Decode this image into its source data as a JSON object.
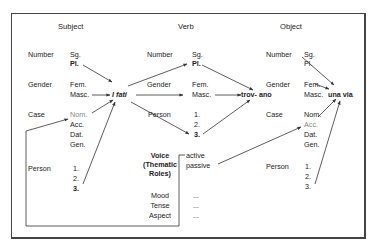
{
  "subject": {
    "title": "Subject",
    "labels": {
      "number": "Number",
      "gender": "Gender",
      "case": "Case",
      "person": "Person"
    },
    "number": [
      "Sg.",
      "Pl."
    ],
    "gender": [
      "Fem.",
      "Masc."
    ],
    "case": [
      "Nom.",
      "Acc.",
      "Dat.",
      "Gen."
    ],
    "person": [
      "1.",
      "2.",
      "3."
    ],
    "word": "I fati"
  },
  "verb": {
    "title": "Verb",
    "labels": {
      "number": "Number",
      "gender": "Gender",
      "person": "Person"
    },
    "number": [
      "Sg.",
      "Pl."
    ],
    "gender": [
      "Fem.",
      "Masc."
    ],
    "person": [
      "1.",
      "2.",
      "3."
    ],
    "word": "trov- ano",
    "voice_label": [
      "Voice",
      "(Thematic",
      "Roles)"
    ],
    "voice": [
      "active",
      "passive"
    ],
    "other_labels": [
      "Mood",
      "Tense",
      "Aspect"
    ],
    "other_values": [
      "...",
      "...",
      "..."
    ]
  },
  "object": {
    "title": "Object",
    "labels": {
      "number": "Number",
      "gender": "Gender",
      "case": "Case",
      "person": "Person"
    },
    "number": [
      "Sg.",
      "Pl."
    ],
    "gender": [
      "Fem.",
      "Masc."
    ],
    "case": [
      "Nom.",
      "Acc.",
      "Dat.",
      "Gen."
    ],
    "person": [
      "1.",
      "2.",
      "3."
    ],
    "word": "una via"
  },
  "colors": {
    "line": "#333333",
    "frame": "#444444",
    "muted": "#888888"
  }
}
